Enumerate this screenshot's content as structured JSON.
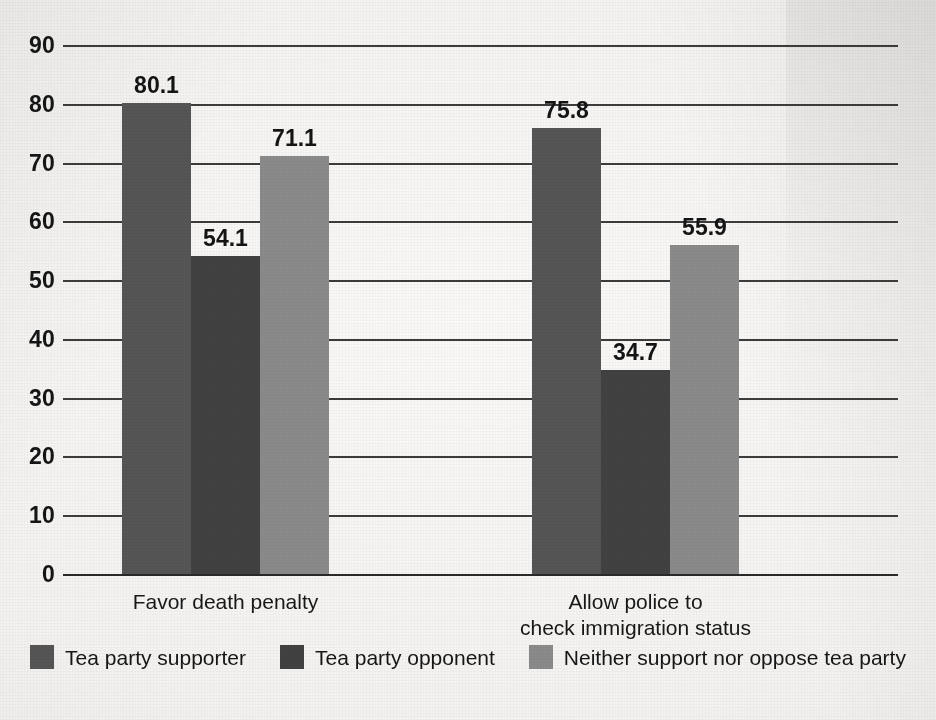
{
  "chart_data": {
    "type": "bar",
    "title": "",
    "subtitle": "",
    "xlabel": "",
    "ylabel": "",
    "ylim": [
      0,
      90
    ],
    "ytick_step": 10,
    "yticks": [
      "90",
      "80",
      "70",
      "60",
      "50",
      "40",
      "30",
      "20",
      "10",
      "0"
    ],
    "grid": true,
    "legend_position": "bottom-center",
    "categories": [
      "Favor death penalty",
      "Allow police to\ncheck immigration status"
    ],
    "series": [
      {
        "name": "Tea party supporter",
        "color": "#555555",
        "values": [
          80.1,
          54.1
        ],
        "value_labels": [
          "80.1",
          "54.1"
        ]
      },
      {
        "name": "Tea party opponent",
        "color": "#414141",
        "values": [
          71.1,
          34.7
        ],
        "value_labels": [
          "71.1",
          "34.7"
        ]
      },
      {
        "name": "Neither support nor oppose tea party",
        "color": "#8a8a8a",
        "values": [
          55.9,
          55.9
        ],
        "value_labels": [
          "71.1",
          "55.9"
        ]
      }
    ],
    "groups": [
      {
        "label": "Favor death penalty",
        "bars": [
          {
            "series": "Tea party supporter",
            "value": 80.1,
            "label": "80.1",
            "color": "#555555"
          },
          {
            "series": "Tea party opponent",
            "value": 54.1,
            "label": "54.1",
            "color": "#414141"
          },
          {
            "series": "Neither support nor oppose tea party",
            "value": 71.1,
            "label": "71.1",
            "color": "#8a8a8a"
          }
        ]
      },
      {
        "label": "Allow police to\ncheck immigration status",
        "bars": [
          {
            "series": "Tea party supporter",
            "value": 75.8,
            "label": "75.8",
            "color": "#555555"
          },
          {
            "series": "Tea party opponent",
            "value": 34.7,
            "label": "34.7",
            "color": "#414141"
          },
          {
            "series": "Neither support nor oppose tea party",
            "value": 55.9,
            "label": "55.9",
            "color": "#8a8a8a"
          }
        ]
      }
    ]
  },
  "legend": {
    "items": [
      {
        "label": "Tea party supporter",
        "color": "#555555"
      },
      {
        "label": "Tea party opponent",
        "color": "#414141"
      },
      {
        "label": "Neither support nor oppose tea party",
        "color": "#8a8a8a"
      }
    ]
  },
  "axis": {
    "y_ticks": [
      "90",
      "80",
      "70",
      "60",
      "50",
      "40",
      "30",
      "20",
      "10",
      "0"
    ]
  },
  "category_labels": [
    "Favor death penalty",
    "Allow police to\ncheck immigration status"
  ]
}
